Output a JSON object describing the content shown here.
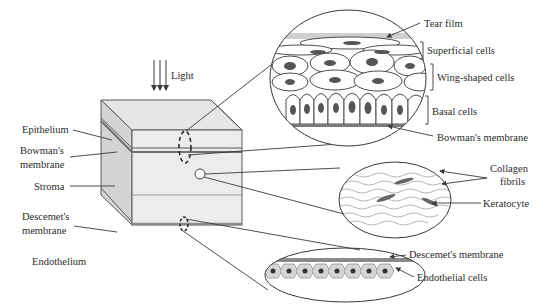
{
  "diagram": {
    "light_label": "Light",
    "cube_labels": [
      {
        "id": "epithelium",
        "text": "Epithelium"
      },
      {
        "id": "bowman-1",
        "text": "Bowman's"
      },
      {
        "id": "bowman-2",
        "text": "membrane"
      },
      {
        "id": "stroma",
        "text": "Stroma"
      },
      {
        "id": "descemet-1",
        "text": "Descemet's"
      },
      {
        "id": "descemet-2",
        "text": "membrane"
      },
      {
        "id": "endothelium",
        "text": "Endothelium"
      }
    ],
    "epithelium_detail": {
      "tear_film": "Tear film",
      "superficial": "Superficial cells",
      "wing": "Wing-shaped cells",
      "basal": "Basal cells",
      "bowman": "Bowman's membrane"
    },
    "stroma_detail": {
      "collagen_1": "Collagen",
      "collagen_2": "fibrils",
      "keratocyte": "Keratocyte"
    },
    "endothelium_detail": {
      "descemet": "Descemet's membrane",
      "endothelial": "Endothelial cells"
    },
    "colors": {
      "line": "#3a3a3a",
      "face_front": "#ececec",
      "face_side": "#d2d2d2",
      "face_top": "#e4e4e4",
      "nucleus": "#555555",
      "membrane": "#7a7a7a"
    }
  }
}
